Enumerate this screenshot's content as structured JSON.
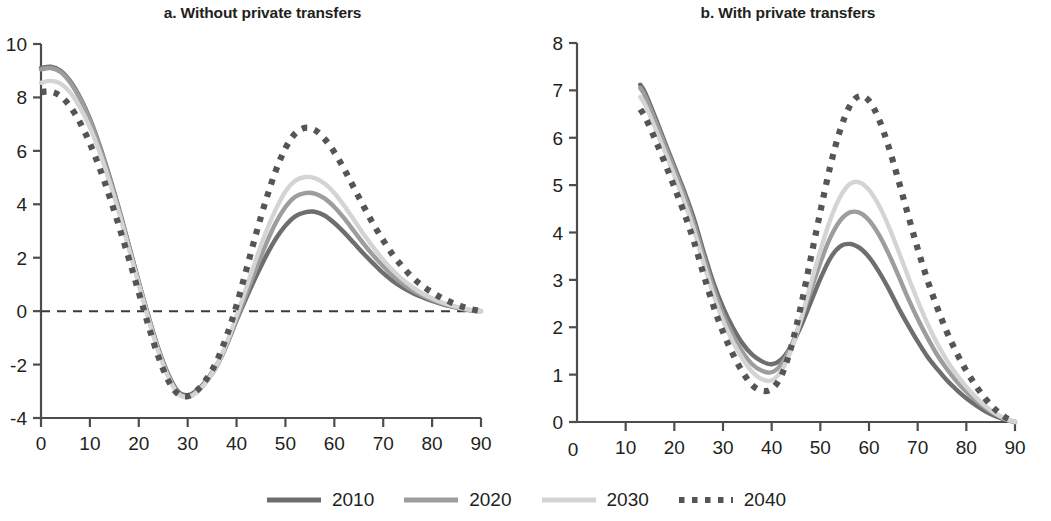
{
  "figure": {
    "axis_title": "Age (years)"
  },
  "panels": [
    {
      "id": "a",
      "title": "a. Without private transfers",
      "xlabel": "Age (years)",
      "ylabel": "",
      "xlim": [
        0,
        90
      ],
      "ylim": [
        -4,
        10
      ],
      "xticks": [
        0,
        10,
        20,
        30,
        40,
        50,
        60,
        70,
        80,
        90
      ],
      "xticklabels": [
        "0",
        "10",
        "20",
        "30",
        "40",
        "50",
        "60",
        "70",
        "80",
        "90"
      ],
      "yticks": [
        -4,
        -2,
        0,
        2,
        4,
        6,
        8,
        10
      ],
      "yticklabels": [
        "-4",
        "-2",
        "0",
        "2",
        "4",
        "6",
        "8",
        "10"
      ],
      "zero_line": 0
    },
    {
      "id": "b",
      "title": "b. With private transfers",
      "xlabel": "Age (years)",
      "ylabel": "",
      "xlim": [
        0,
        90
      ],
      "ylim": [
        0,
        8
      ],
      "xticks": [
        10,
        20,
        30,
        40,
        50,
        60,
        70,
        80,
        90
      ],
      "xticklabels": [
        "10",
        "20",
        "30",
        "40",
        "50",
        "60",
        "70",
        "80",
        "90"
      ],
      "origin_label": "0",
      "yticks": [
        0,
        1,
        2,
        3,
        4,
        5,
        6,
        7,
        8
      ],
      "yticklabels": [
        "0",
        "1",
        "2",
        "3",
        "4",
        "5",
        "6",
        "7",
        "8"
      ],
      "zero_line": null
    }
  ],
  "legend": {
    "position": "bottom-center",
    "items": [
      {
        "label": "2010",
        "color": "#6e6e6e",
        "style": "solid",
        "width": 5
      },
      {
        "label": "2020",
        "color": "#9d9d9d",
        "style": "solid",
        "width": 5
      },
      {
        "label": "2030",
        "color": "#d4d4d4",
        "style": "solid",
        "width": 5
      },
      {
        "label": "2040",
        "color": "#555555",
        "style": "dotted",
        "width": 5
      }
    ]
  },
  "chart_data": [
    {
      "type": "line",
      "panel": "a",
      "title": "a. Without private transfers",
      "xlabel": "Age (years)",
      "ylabel": "",
      "xlim": [
        0,
        90
      ],
      "ylim": [
        -4,
        10
      ],
      "grid": false,
      "zero_reference_line": 0,
      "x": [
        0,
        2,
        4,
        6,
        8,
        10,
        12,
        14,
        16,
        18,
        20,
        22,
        24,
        26,
        28,
        30,
        32,
        34,
        36,
        38,
        40,
        42,
        44,
        46,
        48,
        50,
        52,
        54,
        56,
        58,
        60,
        62,
        64,
        66,
        68,
        70,
        72,
        74,
        76,
        78,
        80,
        82,
        84,
        86,
        88,
        90
      ],
      "series": [
        {
          "name": "2010",
          "color": "#6e6e6e",
          "style": "solid",
          "values": [
            9.1,
            9.15,
            9.0,
            8.6,
            8.0,
            7.2,
            6.2,
            5.05,
            3.8,
            2.45,
            1.1,
            -0.2,
            -1.4,
            -2.35,
            -3.0,
            -3.15,
            -2.95,
            -2.55,
            -2.0,
            -1.25,
            -0.35,
            0.5,
            1.3,
            2.05,
            2.7,
            3.2,
            3.55,
            3.7,
            3.72,
            3.58,
            3.3,
            2.95,
            2.55,
            2.15,
            1.78,
            1.42,
            1.12,
            0.88,
            0.68,
            0.52,
            0.38,
            0.26,
            0.17,
            0.09,
            0.03,
            0.0
          ]
        },
        {
          "name": "2020",
          "color": "#9d9d9d",
          "style": "solid",
          "values": [
            9.05,
            9.1,
            8.95,
            8.55,
            7.95,
            7.15,
            6.15,
            5.0,
            3.75,
            2.4,
            1.05,
            -0.25,
            -1.45,
            -2.4,
            -3.05,
            -3.2,
            -3.0,
            -2.6,
            -2.05,
            -1.25,
            -0.3,
            0.65,
            1.6,
            2.5,
            3.3,
            3.9,
            4.28,
            4.42,
            4.4,
            4.22,
            3.9,
            3.48,
            3.0,
            2.52,
            2.08,
            1.68,
            1.32,
            1.02,
            0.78,
            0.58,
            0.42,
            0.29,
            0.19,
            0.1,
            0.03,
            0.0
          ]
        },
        {
          "name": "2030",
          "color": "#d4d4d4",
          "style": "solid",
          "values": [
            8.55,
            8.62,
            8.52,
            8.18,
            7.62,
            6.88,
            5.95,
            4.85,
            3.65,
            2.32,
            1.0,
            -0.3,
            -1.5,
            -2.45,
            -3.08,
            -3.22,
            -3.02,
            -2.6,
            -2.02,
            -1.18,
            -0.18,
            0.88,
            1.95,
            2.95,
            3.8,
            4.48,
            4.88,
            5.02,
            4.98,
            4.78,
            4.42,
            3.95,
            3.42,
            2.88,
            2.38,
            1.92,
            1.52,
            1.18,
            0.9,
            0.66,
            0.48,
            0.33,
            0.21,
            0.11,
            0.04,
            0.0
          ]
        },
        {
          "name": "2040",
          "color": "#555555",
          "style": "dotted",
          "values": [
            8.2,
            8.22,
            8.05,
            7.65,
            7.05,
            6.28,
            5.35,
            4.3,
            3.15,
            1.95,
            0.7,
            -0.55,
            -1.7,
            -2.58,
            -3.1,
            -3.18,
            -2.95,
            -2.5,
            -1.85,
            -0.92,
            0.22,
            1.55,
            2.9,
            4.15,
            5.25,
            6.1,
            6.65,
            6.86,
            6.78,
            6.45,
            5.95,
            5.32,
            4.62,
            3.92,
            3.25,
            2.65,
            2.1,
            1.65,
            1.26,
            0.95,
            0.7,
            0.49,
            0.32,
            0.18,
            0.07,
            0.0
          ]
        }
      ]
    },
    {
      "type": "line",
      "panel": "b",
      "title": "b. With private transfers",
      "xlabel": "Age (years)",
      "ylabel": "",
      "xlim": [
        0,
        90
      ],
      "ylim": [
        0,
        8
      ],
      "grid": false,
      "zero_reference_line": null,
      "x": [
        13,
        14,
        16,
        18,
        20,
        22,
        24,
        26,
        28,
        30,
        32,
        34,
        36,
        38,
        40,
        42,
        44,
        46,
        48,
        50,
        52,
        54,
        56,
        58,
        60,
        62,
        64,
        66,
        68,
        70,
        72,
        74,
        76,
        78,
        80,
        82,
        84,
        86,
        88,
        90
      ],
      "series": [
        {
          "name": "2010",
          "color": "#6e6e6e",
          "style": "solid",
          "values": [
            7.12,
            6.95,
            6.45,
            5.92,
            5.4,
            4.88,
            4.3,
            3.6,
            2.95,
            2.42,
            2.0,
            1.66,
            1.42,
            1.28,
            1.22,
            1.32,
            1.6,
            2.02,
            2.52,
            3.02,
            3.45,
            3.7,
            3.76,
            3.68,
            3.48,
            3.18,
            2.82,
            2.42,
            2.05,
            1.7,
            1.38,
            1.12,
            0.88,
            0.68,
            0.5,
            0.35,
            0.22,
            0.12,
            0.05,
            0.0
          ]
        },
        {
          "name": "2020",
          "color": "#9d9d9d",
          "style": "solid",
          "values": [
            7.05,
            6.88,
            6.38,
            5.86,
            5.34,
            4.8,
            4.2,
            3.5,
            2.84,
            2.28,
            1.84,
            1.48,
            1.22,
            1.08,
            1.05,
            1.22,
            1.6,
            2.14,
            2.76,
            3.36,
            3.88,
            4.24,
            4.42,
            4.42,
            4.26,
            3.96,
            3.56,
            3.1,
            2.62,
            2.18,
            1.78,
            1.42,
            1.12,
            0.86,
            0.64,
            0.45,
            0.29,
            0.16,
            0.06,
            0.0
          ]
        },
        {
          "name": "2030",
          "color": "#d4d4d4",
          "style": "solid",
          "values": [
            6.86,
            6.7,
            6.22,
            5.72,
            5.2,
            4.66,
            4.06,
            3.36,
            2.7,
            2.14,
            1.7,
            1.34,
            1.06,
            0.9,
            0.88,
            1.08,
            1.52,
            2.16,
            2.9,
            3.62,
            4.26,
            4.74,
            5.02,
            5.06,
            4.9,
            4.58,
            4.14,
            3.62,
            3.08,
            2.56,
            2.08,
            1.66,
            1.3,
            1.0,
            0.74,
            0.52,
            0.33,
            0.18,
            0.07,
            0.0
          ]
        },
        {
          "name": "2040",
          "color": "#555555",
          "style": "dotted",
          "values": [
            6.6,
            6.44,
            5.98,
            5.48,
            4.96,
            4.42,
            3.82,
            3.12,
            2.46,
            1.9,
            1.44,
            1.06,
            0.78,
            0.66,
            0.7,
            0.98,
            1.58,
            2.44,
            3.44,
            4.44,
            5.38,
            6.14,
            6.66,
            6.88,
            6.78,
            6.4,
            5.82,
            5.12,
            4.38,
            3.66,
            3.0,
            2.42,
            1.9,
            1.46,
            1.08,
            0.76,
            0.48,
            0.26,
            0.1,
            0.0
          ]
        }
      ]
    }
  ]
}
